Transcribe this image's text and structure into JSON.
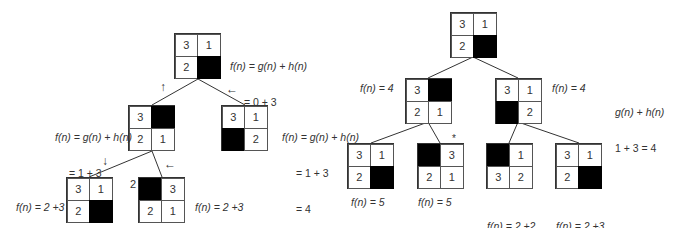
{
  "left_tree": {
    "root": {
      "cells": [
        "3",
        "1",
        "2",
        ""
      ],
      "label": [
        "f(n) = g(n) + h(n)",
        "= 0 + 3",
        "= 3"
      ]
    },
    "level1_left": {
      "cells": [
        "3",
        "",
        "2",
        "1"
      ],
      "label": [
        "f(n) = g(n) + h(n)",
        "= 1 + 3",
        "= 4"
      ],
      "arrow": "↑"
    },
    "level1_right": {
      "cells": [
        "3",
        "1",
        "",
        "2"
      ],
      "label": [
        "f(n) = g(n) + h(n)",
        "= 1 + 3",
        "= 4"
      ],
      "arrow": "←"
    },
    "level2_left": {
      "cells": [
        "3",
        "1",
        "2",
        ""
      ],
      "label": [
        "f(n) = 2 +3",
        "= 5"
      ],
      "arrow": "↓"
    },
    "level2_right": {
      "cells": [
        "",
        "3",
        "2",
        "1"
      ],
      "label": [
        "f(n) = 2 +3",
        "= 5"
      ],
      "arrow": "←",
      "side_number": "2"
    }
  },
  "right_tree": {
    "root": {
      "cells": [
        "3",
        "1",
        "2",
        ""
      ]
    },
    "level1_left": {
      "cells": [
        "3",
        "",
        "2",
        "1"
      ],
      "label": "f(n) = 4"
    },
    "level1_right": {
      "cells": [
        "3",
        "1",
        "",
        "2"
      ],
      "label": "f(n) = 4"
    },
    "note": [
      "g(n) + h(n)",
      "1 + 3 = 4"
    ],
    "level2": [
      {
        "cells": [
          "3",
          "1",
          "2",
          ""
        ],
        "label": [
          "f(n) = 5"
        ]
      },
      {
        "cells": [
          "",
          "3",
          "2",
          "1"
        ],
        "label": [
          "f(n) = 5"
        ],
        "marker": "*"
      },
      {
        "cells": [
          "",
          "1",
          "3",
          "2"
        ],
        "label": [
          "f(n) = 2 +2",
          "= 4"
        ]
      },
      {
        "cells": [
          "3",
          "1",
          "2",
          ""
        ],
        "label": [
          "f(n) = 2 +3",
          "= 5"
        ]
      }
    ]
  }
}
